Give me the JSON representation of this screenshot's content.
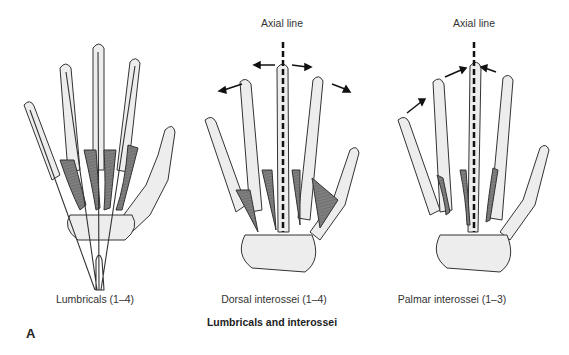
{
  "figure": {
    "panel_letter": "A",
    "title": "Lumbricals and interossei",
    "panels": [
      {
        "caption": "Lumbricals (1–4)",
        "axial_label": null,
        "arrows": "none"
      },
      {
        "caption": "Dorsal interossei (1–4)",
        "axial_label": "Axial line",
        "arrows": "abduction (away from axial line)"
      },
      {
        "caption": "Palmar interossei (1–3)",
        "axial_label": "Axial line",
        "arrows": "adduction (toward axial line)"
      }
    ]
  },
  "colors": {
    "bone": "#ededed",
    "outline": "#333333",
    "muscle": "#7a7a7a",
    "cartilage": "#b8b8b8",
    "axial_line": "#111111"
  }
}
